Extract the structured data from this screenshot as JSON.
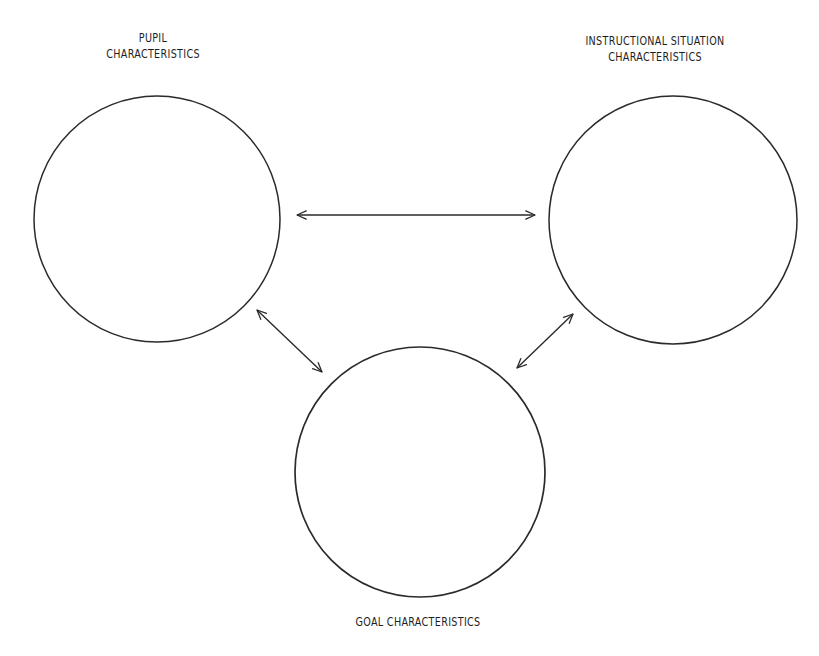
{
  "diagram": {
    "type": "relationship-diagram",
    "nodes": [
      {
        "id": "pupil",
        "label_lines": [
          "PUPIL",
          "CHARACTERISTICS"
        ],
        "shape": "circle",
        "center": [
          157,
          219
        ],
        "radius": 123
      },
      {
        "id": "instructional",
        "label_lines": [
          "INSTRUCTIONAL SITUATION",
          "CHARACTERISTICS"
        ],
        "shape": "circle",
        "center": [
          673,
          220
        ],
        "radius": 124
      },
      {
        "id": "goal",
        "label_lines": [
          "GOAL CHARACTERISTICS"
        ],
        "shape": "circle",
        "center": [
          420,
          472
        ],
        "radius": 125
      }
    ],
    "edges": [
      {
        "from": "pupil",
        "to": "instructional",
        "direction": "bidirectional",
        "x1": 297,
        "y1": 215,
        "x2": 535,
        "y2": 215
      },
      {
        "from": "pupil",
        "to": "goal",
        "direction": "bidirectional",
        "x1": 257,
        "y1": 310,
        "x2": 322,
        "y2": 372
      },
      {
        "from": "instructional",
        "to": "goal",
        "direction": "bidirectional",
        "x1": 573,
        "y1": 314,
        "x2": 517,
        "y2": 368
      }
    ],
    "colors": {
      "stroke": "#2a2a2a",
      "text": "#1e1e1e",
      "background": "#ffffff"
    }
  },
  "labels": {
    "pupil": {
      "line1": "PUPIL",
      "line2": "CHARACTERISTICS"
    },
    "instructional": {
      "line1": "INSTRUCTIONAL SITUATION",
      "line2": "CHARACTERISTICS"
    },
    "goal": {
      "line1": "GOAL CHARACTERISTICS"
    }
  }
}
